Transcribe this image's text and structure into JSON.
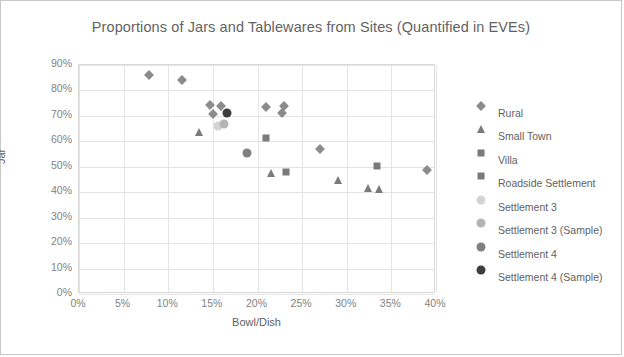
{
  "chart_data": {
    "type": "scatter",
    "title": "Proportions of Jars and Tablewares from Sites (Quantified in EVEs)",
    "xlabel": "Bowl/Dish",
    "ylabel": "Jar",
    "xlim": [
      0,
      40
    ],
    "ylim": [
      0,
      90
    ],
    "xticks": [
      "0%",
      "5%",
      "10%",
      "15%",
      "20%",
      "25%",
      "30%",
      "35%",
      "40%"
    ],
    "yticks": [
      "90%",
      "80%",
      "70%",
      "60%",
      "50%",
      "40%",
      "30%",
      "20%",
      "10%",
      "0%"
    ],
    "xtick_values": [
      0,
      5,
      10,
      15,
      20,
      25,
      30,
      35,
      40
    ],
    "ytick_values": [
      90,
      80,
      70,
      60,
      50,
      40,
      30,
      20,
      10,
      0
    ],
    "grid": true,
    "legend_position": "right",
    "axis_unit": "percent",
    "series": [
      {
        "name": "Rural",
        "marker": "diamond",
        "color": "#8c8c8c",
        "points": [
          {
            "x": 7.8,
            "y": 86.0
          },
          {
            "x": 11.5,
            "y": 84.0
          },
          {
            "x": 14.7,
            "y": 74.2
          },
          {
            "x": 15.9,
            "y": 74.0
          },
          {
            "x": 15.0,
            "y": 70.8
          },
          {
            "x": 21.0,
            "y": 73.6
          },
          {
            "x": 23.0,
            "y": 74.0
          },
          {
            "x": 22.8,
            "y": 71.0
          },
          {
            "x": 27.0,
            "y": 56.8
          },
          {
            "x": 39.0,
            "y": 48.6
          }
        ]
      },
      {
        "name": "Small Town",
        "marker": "triangle",
        "color": "#7a7a7a",
        "points": [
          {
            "x": 13.4,
            "y": 63.8
          },
          {
            "x": 21.5,
            "y": 47.4
          },
          {
            "x": 29.0,
            "y": 44.8
          },
          {
            "x": 32.4,
            "y": 41.6
          },
          {
            "x": 33.6,
            "y": 41.4
          }
        ]
      },
      {
        "name": "Villa",
        "marker": "square",
        "color": "#7a7a7a",
        "points": [
          {
            "x": 21.0,
            "y": 61.2
          }
        ]
      },
      {
        "name": "Roadside Settlement",
        "marker": "square",
        "color": "#7a7a7a",
        "points": [
          {
            "x": 23.2,
            "y": 47.8
          },
          {
            "x": 33.4,
            "y": 50.2
          }
        ]
      },
      {
        "name": "Settlement 3",
        "marker": "circle",
        "color": "#d4d4d4",
        "points": [
          {
            "x": 15.6,
            "y": 66.2
          }
        ]
      },
      {
        "name": "Settlement 3 (Sample)",
        "marker": "circle",
        "color": "#b4b4b4",
        "points": [
          {
            "x": 16.2,
            "y": 67.0
          }
        ]
      },
      {
        "name": "Settlement 4",
        "marker": "circle",
        "color": "#808080",
        "points": [
          {
            "x": 18.8,
            "y": 55.4
          }
        ]
      },
      {
        "name": "Settlement 4 (Sample)",
        "marker": "circle",
        "color": "#3d3d3d",
        "points": [
          {
            "x": 16.6,
            "y": 71.0
          }
        ]
      }
    ]
  },
  "legend": {
    "items": [
      {
        "label": "Rural",
        "marker": "diamond",
        "color": "#8c8c8c"
      },
      {
        "label": "Small Town",
        "marker": "triangle",
        "color": "#7a7a7a"
      },
      {
        "label": "Villa",
        "marker": "square",
        "color": "#7a7a7a"
      },
      {
        "label": "Roadside Settlement",
        "marker": "square",
        "color": "#7a7a7a"
      },
      {
        "label": "Settlement 3",
        "marker": "circle",
        "color": "#d4d4d4"
      },
      {
        "label": "Settlement 3 (Sample)",
        "marker": "circle",
        "color": "#b4b4b4"
      },
      {
        "label": "Settlement 4",
        "marker": "circle",
        "color": "#808080"
      },
      {
        "label": "Settlement 4 (Sample)",
        "marker": "circle",
        "color": "#3d3d3d"
      }
    ]
  },
  "colors": {
    "title_text": "#636363",
    "axis_text": "#828282",
    "axis_label_text": "#5f5f5f",
    "gridline": "#e4e4e4",
    "plot_border": "#d9d9d9",
    "frame_border": "#c8c8c8",
    "background": "#ffffff"
  }
}
